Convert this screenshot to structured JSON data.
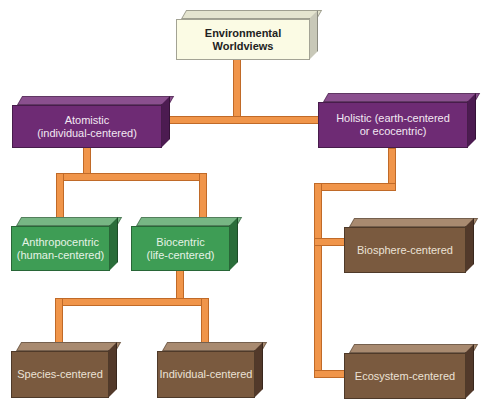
{
  "diagram": {
    "type": "hierarchy",
    "colors": {
      "connector": "#f0954a",
      "root": "#fbfbe4",
      "level1": "#6e2b74",
      "level2": "#3e9d55",
      "leaf": "#7a5a3f"
    },
    "nodes": {
      "root": {
        "label": "Environmental Worldviews",
        "line1": "Environmental",
        "line2": "Worldviews"
      },
      "atomistic": {
        "label": "Atomistic (individual-centered)",
        "line1": "Atomistic",
        "line2": "(individual-centered)"
      },
      "holistic": {
        "label": "Holistic (earth-centered or ecocentric)",
        "line1": "Holistic (earth-centered",
        "line2": "or ecocentric)"
      },
      "anthropocentric": {
        "label": "Anthropocentric (human-centered)",
        "line1": "Anthropocentric",
        "line2": "(human-centered)"
      },
      "biocentric": {
        "label": "Biocentric (life-centered)",
        "line1": "Biocentric",
        "line2": "(life-centered)"
      },
      "species": {
        "label": "Species-centered"
      },
      "individual": {
        "label": "Individual-centered"
      },
      "biosphere": {
        "label": "Biosphere-centered"
      },
      "ecosystem": {
        "label": "Ecosystem-centered"
      }
    },
    "edges": [
      [
        "root",
        "atomistic"
      ],
      [
        "root",
        "holistic"
      ],
      [
        "atomistic",
        "anthropocentric"
      ],
      [
        "atomistic",
        "biocentric"
      ],
      [
        "biocentric",
        "species"
      ],
      [
        "biocentric",
        "individual"
      ],
      [
        "holistic",
        "biosphere"
      ],
      [
        "holistic",
        "ecosystem"
      ]
    ]
  }
}
